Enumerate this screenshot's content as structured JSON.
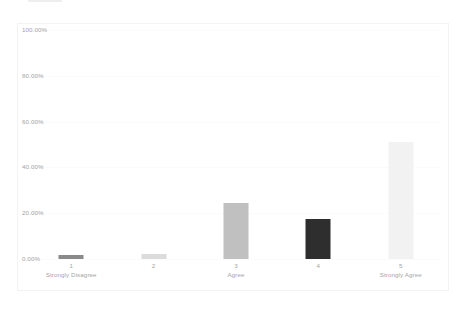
{
  "chart_data": {
    "type": "bar",
    "title": "",
    "subtitle": "",
    "xlabel": "",
    "ylabel": "",
    "categories": [
      "1",
      "2",
      "3",
      "4",
      "5"
    ],
    "category_sublabels": [
      "Strongly Disagree",
      "",
      "Agree",
      "",
      "Strongly Agree"
    ],
    "values": [
      1.8,
      2.2,
      24.5,
      17.5,
      50.9
    ],
    "value_labels": [
      "1.80%",
      "2.20%",
      "24.50%",
      "17.50%",
      "50.90%"
    ],
    "bar_colors": [
      "#8a8a8a",
      "#dcdcdc",
      "#c0c0c0",
      "#2e2e2e",
      "#f2f2f2"
    ],
    "ylim": [
      0,
      100
    ],
    "y_ticks": [
      0,
      20,
      40,
      60,
      80,
      100
    ],
    "y_tick_labels": [
      "0.00%",
      "20.00%",
      "40.00%",
      "60.00%",
      "80.00%",
      "100.00%"
    ],
    "grid": true,
    "grid_color": "#fbfbfb",
    "legend": "none",
    "legend_position": "none",
    "axis_label_color": "#a4a4a4",
    "plot_border_color": "#f3f3f3",
    "background_color": "#ffffff",
    "annotations": []
  },
  "accessibility": {
    "chart_description": "Vertical bar chart of Likert survey responses from 1 Strongly Disagree to 5 Strongly Agree, percentage of respondents"
  }
}
